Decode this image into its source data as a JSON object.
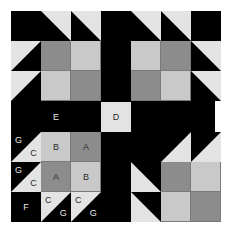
{
  "figure": {
    "background_color": "#ffffff",
    "frame_color": "#000000"
  },
  "palette": {
    "black": "#000000",
    "dark_gray": "#8c8c8c",
    "mid_gray": "#a8a8a8",
    "light_gray": "#c9c9c9",
    "pale": "#e3e3e3",
    "seam_line": "#7a7a7a",
    "label_dark": "#2b2b2b",
    "label_light": "#e8e8e8"
  },
  "patch_labels": {
    "A": "A",
    "B": "B",
    "C": "C",
    "D": "D",
    "E": "E",
    "F": "F",
    "G": "G"
  },
  "sashing": {
    "horizontal_left": {
      "label": "E",
      "fill": "#000000",
      "text_color": "#e8e8e8"
    },
    "horizontal_right": {
      "label": "",
      "fill": "#000000",
      "text_color": "#e8e8e8"
    },
    "center_square": {
      "label": "D",
      "fill": "#e3e3e3",
      "text_color": "#2b2b2b"
    },
    "vertical_top": {
      "label": "",
      "fill": "#000000"
    },
    "vertical_bottom": {
      "label": "",
      "fill": "#000000"
    }
  },
  "blocks": [
    {
      "name": "top-left-block",
      "position": "top-left",
      "rotation_deg": 0,
      "cells": [
        {
          "r": 0,
          "c": 0,
          "type": "solid",
          "fill": "#000000",
          "label": ""
        },
        {
          "r": 0,
          "c": 1,
          "type": "hst",
          "orient": "tr",
          "fill": "#e3e3e3",
          "bg": "#000000",
          "label": ""
        },
        {
          "r": 0,
          "c": 2,
          "type": "hst",
          "orient": "tr",
          "fill": "#e3e3e3",
          "bg": "#000000",
          "label": ""
        },
        {
          "r": 1,
          "c": 0,
          "type": "hst",
          "orient": "tl",
          "fill": "#e3e3e3",
          "bg": "#000000",
          "label": ""
        },
        {
          "r": 1,
          "c": 1,
          "type": "solid",
          "fill": "#8c8c8c",
          "label": ""
        },
        {
          "r": 1,
          "c": 2,
          "type": "solid",
          "fill": "#c9c9c9",
          "label": ""
        },
        {
          "r": 2,
          "c": 0,
          "type": "hst",
          "orient": "tl",
          "fill": "#e3e3e3",
          "bg": "#000000",
          "label": ""
        },
        {
          "r": 2,
          "c": 1,
          "type": "solid",
          "fill": "#c9c9c9",
          "label": ""
        },
        {
          "r": 2,
          "c": 2,
          "type": "solid",
          "fill": "#8c8c8c",
          "label": ""
        }
      ]
    },
    {
      "name": "top-right-block",
      "position": "top-right",
      "rotation_deg": 0,
      "cells": [
        {
          "r": 0,
          "c": 0,
          "type": "hst",
          "orient": "tr",
          "fill": "#e3e3e3",
          "bg": "#000000",
          "label": ""
        },
        {
          "r": 0,
          "c": 1,
          "type": "hst",
          "orient": "tr",
          "fill": "#e3e3e3",
          "bg": "#000000",
          "label": ""
        },
        {
          "r": 0,
          "c": 2,
          "type": "solid",
          "fill": "#000000",
          "label": ""
        },
        {
          "r": 1,
          "c": 0,
          "type": "solid",
          "fill": "#c9c9c9",
          "label": ""
        },
        {
          "r": 1,
          "c": 1,
          "type": "solid",
          "fill": "#8c8c8c",
          "label": ""
        },
        {
          "r": 1,
          "c": 2,
          "type": "hst",
          "orient": "tr2",
          "fill": "#e3e3e3",
          "bg": "#000000",
          "label": ""
        },
        {
          "r": 2,
          "c": 0,
          "type": "solid",
          "fill": "#8c8c8c",
          "label": ""
        },
        {
          "r": 2,
          "c": 1,
          "type": "solid",
          "fill": "#c9c9c9",
          "label": ""
        },
        {
          "r": 2,
          "c": 2,
          "type": "hst",
          "orient": "tr2",
          "fill": "#e3e3e3",
          "bg": "#000000",
          "label": ""
        }
      ]
    },
    {
      "name": "bottom-left-block",
      "position": "bottom-left",
      "rotation_deg": 0,
      "cells": [
        {
          "r": 0,
          "c": 0,
          "type": "hst",
          "orient": "br",
          "fill": "#e3e3e3",
          "bg": "#000000",
          "label": "G",
          "label2": "C"
        },
        {
          "r": 0,
          "c": 1,
          "type": "solid",
          "fill": "#c9c9c9",
          "label": "B"
        },
        {
          "r": 0,
          "c": 2,
          "type": "solid",
          "fill": "#8c8c8c",
          "label": "A"
        },
        {
          "r": 1,
          "c": 0,
          "type": "hst",
          "orient": "br",
          "fill": "#e3e3e3",
          "bg": "#000000",
          "label": "G",
          "label2": "C"
        },
        {
          "r": 1,
          "c": 1,
          "type": "solid",
          "fill": "#8c8c8c",
          "label": "A"
        },
        {
          "r": 1,
          "c": 2,
          "type": "solid",
          "fill": "#c9c9c9",
          "label": "B"
        },
        {
          "r": 2,
          "c": 0,
          "type": "solid",
          "fill": "#000000",
          "label": "F"
        },
        {
          "r": 2,
          "c": 1,
          "type": "hst",
          "orient": "tl2",
          "fill": "#e3e3e3",
          "bg": "#000000",
          "label": "C",
          "label2": "G"
        },
        {
          "r": 2,
          "c": 2,
          "type": "hst",
          "orient": "tl2",
          "fill": "#e3e3e3",
          "bg": "#000000",
          "label": "C",
          "label2": "G"
        }
      ]
    },
    {
      "name": "bottom-right-block",
      "position": "bottom-right",
      "rotation_deg": 180,
      "cells": [
        {
          "r": 0,
          "c": 0,
          "type": "solid",
          "fill": "#8c8c8c",
          "label": ""
        },
        {
          "r": 0,
          "c": 1,
          "type": "solid",
          "fill": "#c9c9c9",
          "label": ""
        },
        {
          "r": 0,
          "c": 2,
          "type": "hst",
          "orient": "tr2",
          "fill": "#e3e3e3",
          "bg": "#000000",
          "label": ""
        },
        {
          "r": 1,
          "c": 0,
          "type": "solid",
          "fill": "#c9c9c9",
          "label": ""
        },
        {
          "r": 1,
          "c": 1,
          "type": "solid",
          "fill": "#8c8c8c",
          "label": ""
        },
        {
          "r": 1,
          "c": 2,
          "type": "hst",
          "orient": "tr2",
          "fill": "#e3e3e3",
          "bg": "#000000",
          "label": ""
        },
        {
          "r": 2,
          "c": 0,
          "type": "hst",
          "orient": "tl2",
          "fill": "#e3e3e3",
          "bg": "#000000",
          "label": ""
        },
        {
          "r": 2,
          "c": 1,
          "type": "hst",
          "orient": "tl2",
          "fill": "#e3e3e3",
          "bg": "#000000",
          "label": ""
        },
        {
          "r": 2,
          "c": 2,
          "type": "solid",
          "fill": "#000000",
          "label": ""
        }
      ]
    }
  ]
}
